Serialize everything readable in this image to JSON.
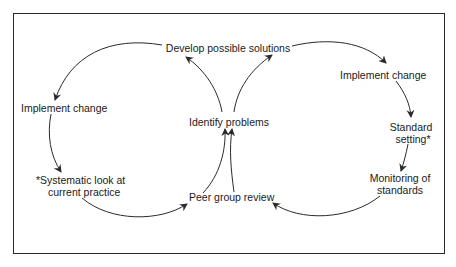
{
  "diagram": {
    "type": "double-cycle flow diagram",
    "nodes": {
      "develop": "Develop possible solutions",
      "identify": "Identify problems",
      "peer_review": "Peer group review",
      "left_implement": "Implement change",
      "systematic_line1": "*Systematic look at",
      "systematic_line2": "current  practice",
      "right_implement": "Implement change",
      "standard_line1": "Standard",
      "standard_line2": "setting*",
      "monitoring_line1": "Monitoring of",
      "monitoring_line2": "standards"
    },
    "left_cycle": [
      "Identify problems",
      "Develop possible solutions",
      "Implement change",
      "*Systematic look at current practice",
      "Peer group review",
      "Identify problems"
    ],
    "right_cycle": [
      "Identify problems",
      "Develop possible solutions",
      "Implement change",
      "Standard setting*",
      "Monitoring of standards",
      "Peer group review",
      "Identify problems"
    ],
    "colors": {
      "line": "#2a2a2a",
      "text": "#1a1a1a",
      "background": "#ffffff"
    }
  }
}
